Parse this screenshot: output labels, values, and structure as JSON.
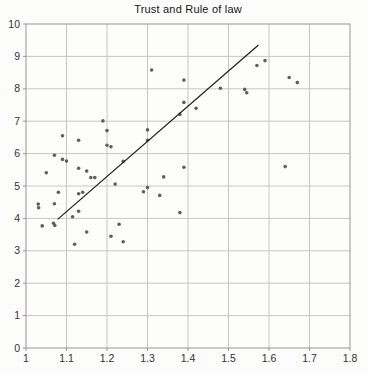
{
  "chart_data": {
    "type": "scatter",
    "title": "Trust and Rule of law",
    "xlabel": "",
    "ylabel": "",
    "xlim": [
      1.0,
      1.8
    ],
    "ylim": [
      0,
      10
    ],
    "x_ticks": [
      1,
      1.1,
      1.2,
      1.3,
      1.4,
      1.5,
      1.6,
      1.7,
      1.8
    ],
    "x_tick_labels": [
      "1",
      "1.1",
      "1.2",
      "1.3",
      "1.4",
      "1.5",
      "1.6",
      "1.7",
      "1.8"
    ],
    "y_ticks": [
      0,
      1,
      2,
      3,
      4,
      5,
      6,
      7,
      8,
      9,
      10
    ],
    "y_tick_labels": [
      "0",
      "1",
      "2",
      "3",
      "4",
      "5",
      "6",
      "7",
      "8",
      "9",
      "10"
    ],
    "grid": true,
    "legend": false,
    "points": [
      [
        1.31,
        8.58
      ],
      [
        1.39,
        8.27
      ],
      [
        1.48,
        8.02
      ],
      [
        1.54,
        7.98
      ],
      [
        1.545,
        7.88
      ],
      [
        1.57,
        8.72
      ],
      [
        1.59,
        8.87
      ],
      [
        1.65,
        8.35
      ],
      [
        1.67,
        8.19
      ],
      [
        1.64,
        5.6
      ],
      [
        1.39,
        7.58
      ],
      [
        1.42,
        7.4
      ],
      [
        1.38,
        7.21
      ],
      [
        1.19,
        7.01
      ],
      [
        1.2,
        6.71
      ],
      [
        1.3,
        6.73
      ],
      [
        1.3,
        6.41
      ],
      [
        1.09,
        6.55
      ],
      [
        1.13,
        6.41
      ],
      [
        1.2,
        6.26
      ],
      [
        1.21,
        6.21
      ],
      [
        1.07,
        5.95
      ],
      [
        1.09,
        5.82
      ],
      [
        1.1,
        5.77
      ],
      [
        1.13,
        5.55
      ],
      [
        1.15,
        5.46
      ],
      [
        1.16,
        5.26
      ],
      [
        1.17,
        5.26
      ],
      [
        1.05,
        5.41
      ],
      [
        1.24,
        5.76
      ],
      [
        1.22,
        5.06
      ],
      [
        1.29,
        4.82
      ],
      [
        1.3,
        4.95
      ],
      [
        1.33,
        4.71
      ],
      [
        1.34,
        5.28
      ],
      [
        1.39,
        5.58
      ],
      [
        1.08,
        4.81
      ],
      [
        1.13,
        4.76
      ],
      [
        1.14,
        4.81
      ],
      [
        1.03,
        4.44
      ],
      [
        1.031,
        4.33
      ],
      [
        1.07,
        4.45
      ],
      [
        1.115,
        4.05
      ],
      [
        1.13,
        4.22
      ],
      [
        1.38,
        4.18
      ],
      [
        1.04,
        3.77
      ],
      [
        1.068,
        3.85
      ],
      [
        1.071,
        3.78
      ],
      [
        1.15,
        3.58
      ],
      [
        1.12,
        3.2
      ],
      [
        1.21,
        3.45
      ],
      [
        1.23,
        3.82
      ],
      [
        1.24,
        3.28
      ]
    ],
    "trendline": {
      "x1": 1.078,
      "y1": 3.97,
      "x2": 1.574,
      "y2": 9.35
    },
    "colors": {
      "point": "#5f5f5f",
      "line": "#222222",
      "grid": "#c6c6c4",
      "axis": "#969694",
      "tick_label": "#333333",
      "title": "#161616",
      "plot_background": "#fdfdfb"
    }
  }
}
